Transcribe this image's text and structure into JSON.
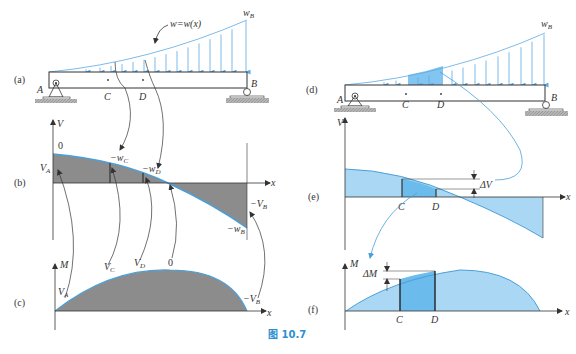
{
  "figure": {
    "caption": "图 10.7",
    "colors": {
      "load_arrow": "#5aa9e6",
      "shaded_gray": "#8c8c8c",
      "curve_blue": "#4a9fd8",
      "light_blue_fill": "#aad8f4",
      "dark_blue_fill": "#6bbbed",
      "caption": "#2e8fd0",
      "ground_hatch": "#9a9a9a",
      "line": "#333333"
    },
    "panels": {
      "a": {
        "label": "(a)",
        "load_label": "w=w(x)",
        "wB": "w",
        "wB_sub": "B",
        "point_A": "A",
        "point_B": "B",
        "point_C": "C",
        "point_D": "D"
      },
      "b": {
        "label": "(b)",
        "axis_v": "V",
        "axis_x": "x",
        "zero": "0",
        "VA": "V",
        "VA_sub": "A",
        "wC": "−w",
        "wC_sub": "C",
        "wD": "−w",
        "wD_sub": "D",
        "VB": "−V",
        "VB_sub": "B",
        "wB": "−w",
        "wB_sub": "B"
      },
      "c": {
        "label": "(c)",
        "axis_m": "M",
        "axis_x": "x",
        "VA": "V",
        "VA_sub": "A",
        "VC": "V",
        "VC_sub": "C",
        "VD": "V",
        "VD_sub": "D",
        "zero": "0",
        "VB": "−V",
        "VB_sub": "B"
      },
      "d": {
        "label": "(d)",
        "wB": "w",
        "wB_sub": "B",
        "point_A": "A",
        "point_B": "B",
        "point_C": "C",
        "point_D": "D"
      },
      "e": {
        "label": "(e)",
        "axis_v": "V",
        "axis_x": "x",
        "delta": "ΔV",
        "point_C": "C",
        "point_D": "D"
      },
      "f": {
        "label": "(f)",
        "axis_m": "M",
        "axis_x": "x",
        "delta": "ΔM",
        "point_C": "C",
        "point_D": "D"
      }
    }
  }
}
